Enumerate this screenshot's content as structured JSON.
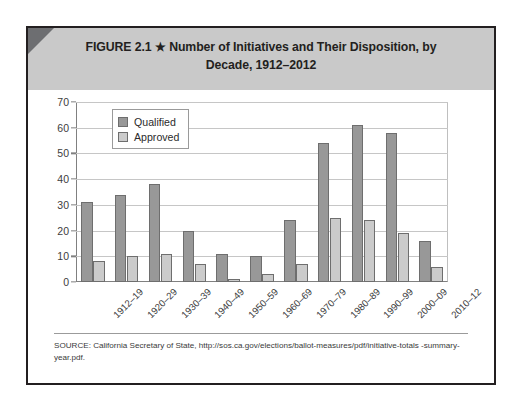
{
  "figure": {
    "label": "FIGURE 2.1",
    "star": "★",
    "title_line1": "Number of Initiatives and Their Disposition, by",
    "title_line2": "Decade, 1912–2012"
  },
  "source": {
    "line1": "SOURCE: California Secretary of State, http://sos.ca.gov/elections/ballot-measures/pdf/initiative-totals",
    "line2": "-summary-year.pdf."
  },
  "colors": {
    "qualified": "#989898",
    "approved": "#cbcbcb",
    "bar_border": "#6e6e6e",
    "header_band": "#c9c9c9",
    "corner_accent": "#6d6e71",
    "frame": "#231f20",
    "gridline": "#c6c6c6",
    "axis": "#808080"
  },
  "chart_data": {
    "type": "bar",
    "title": "Number of Initiatives and Their Disposition, by Decade, 1912–2012",
    "xlabel": "",
    "ylabel": "",
    "ylim": [
      0,
      70
    ],
    "yticks": [
      0,
      10,
      20,
      30,
      40,
      50,
      60,
      70
    ],
    "grid": true,
    "legend_position": "upper-left-inside",
    "categories": [
      "1912–19",
      "1920–29",
      "1930–39",
      "1940–49",
      "1950–59",
      "1960–69",
      "1970–79",
      "1980–89",
      "1990–99",
      "2000–09",
      "2010–12"
    ],
    "series": [
      {
        "name": "Qualified",
        "values": [
          31,
          34,
          38,
          20,
          11,
          10,
          24,
          54,
          61,
          58,
          16
        ]
      },
      {
        "name": "Approved",
        "values": [
          8,
          10,
          11,
          7,
          1,
          3,
          7,
          25,
          24,
          19,
          6
        ]
      }
    ]
  }
}
